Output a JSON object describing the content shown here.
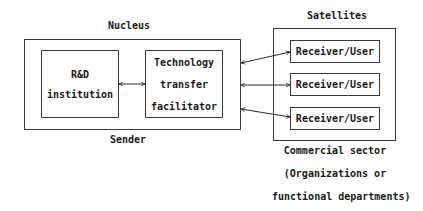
{
  "nucleus": {
    "title": "Nucleus",
    "footer": "Sender",
    "rd_box": {
      "line1": "R&D",
      "line2": "institution"
    },
    "tt_box": {
      "line1": "Technology",
      "line2": "transfer",
      "line3": "facilitator"
    }
  },
  "satellites": {
    "title": "Satellites",
    "receivers": [
      {
        "label": "Receiver/User"
      },
      {
        "label": "Receiver/User"
      },
      {
        "label": "Receiver/User"
      }
    ],
    "footer_lines": [
      "Commercial sector",
      "(Organizations or",
      "functional departments)"
    ]
  },
  "connections": [
    {
      "from": "R&D institution",
      "to": "Technology transfer facilitator",
      "type": "bidirectional"
    },
    {
      "from": "Nucleus",
      "to": "Receiver/User 1",
      "type": "bidirectional"
    },
    {
      "from": "Nucleus",
      "to": "Receiver/User 2",
      "type": "bidirectional"
    },
    {
      "from": "Nucleus",
      "to": "Receiver/User 3",
      "type": "bidirectional"
    }
  ]
}
